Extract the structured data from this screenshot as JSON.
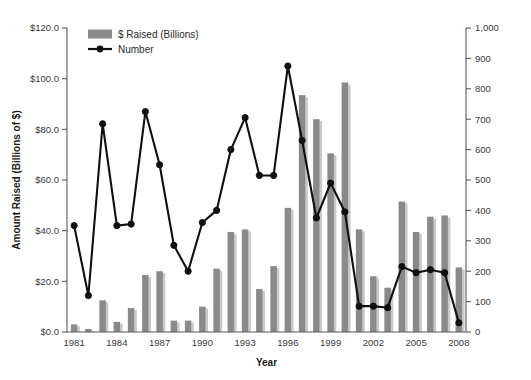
{
  "chart_data": {
    "type": "bar",
    "title": "",
    "xlabel": "Year",
    "ylabel": "Amount Raised (Billions of $)",
    "y2label": "",
    "ylim": [
      0,
      120
    ],
    "y2lim": [
      0,
      1000
    ],
    "grid": false,
    "legend_position": "top-left",
    "categories": [
      "1981",
      "1982",
      "1983",
      "1984",
      "1985",
      "1986",
      "1987",
      "1988",
      "1989",
      "1990",
      "1991",
      "1992",
      "1993",
      "1994",
      "1995",
      "1996",
      "1997",
      "1998",
      "1999",
      "2000",
      "2001",
      "2002",
      "2003",
      "2004",
      "2005",
      "2006",
      "2007",
      "2008"
    ],
    "x_tick_labels": [
      "1981",
      "1984",
      "1987",
      "1990",
      "1993",
      "1996",
      "1999",
      "2002",
      "2005",
      "2008"
    ],
    "y_tick_labels": [
      "$0.0",
      "$20.0",
      "$40.0",
      "$60.0",
      "$80.0",
      "$100.0",
      "$120.0"
    ],
    "y_tick_values": [
      0,
      20,
      40,
      60,
      80,
      100,
      120
    ],
    "y2_tick_labels": [
      "0",
      "100",
      "200",
      "300",
      "400",
      "500",
      "600",
      "700",
      "800",
      "900",
      "1,000"
    ],
    "y2_tick_values": [
      0,
      100,
      200,
      300,
      400,
      500,
      600,
      700,
      800,
      900,
      1000
    ],
    "series": [
      {
        "name": "$ Raised (Billions)",
        "type": "bar",
        "axis": "left",
        "color": "#8a8a8a",
        "values": [
          3.0,
          1.2,
          12.5,
          4.0,
          9.5,
          22.5,
          24.0,
          4.5,
          4.5,
          10.0,
          25.0,
          39.5,
          40.5,
          17.0,
          26.0,
          49.0,
          93.5,
          84.0,
          70.5,
          98.5,
          40.5,
          22.0,
          17.5,
          51.5,
          39.5,
          45.5,
          46.0,
          25.5
        ]
      },
      {
        "name": "Number",
        "type": "line",
        "axis": "right",
        "color": "#101010",
        "values": [
          350,
          120,
          685,
          350,
          355,
          725,
          550,
          285,
          200,
          360,
          400,
          600,
          705,
          515,
          515,
          875,
          630,
          375,
          490,
          395,
          85,
          85,
          80,
          215,
          195,
          205,
          195,
          30
        ]
      }
    ]
  },
  "legend": {
    "items": [
      {
        "label": "$ Raised (Billions)",
        "marker": "bar-swatch",
        "color": "#8a8a8a"
      },
      {
        "label": "Number",
        "marker": "line-dot",
        "color": "#101010"
      }
    ]
  }
}
